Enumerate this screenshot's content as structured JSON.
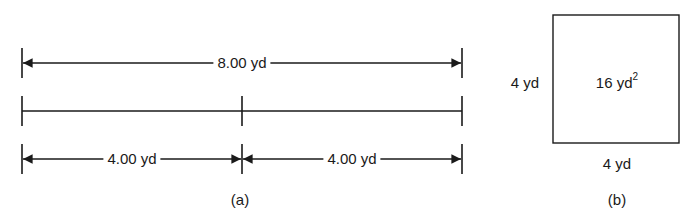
{
  "figure_a": {
    "caption": "(a)",
    "total_dimension": "8.00 yd",
    "segments": [
      {
        "label": "4.00 yd"
      },
      {
        "label": "4.00 yd"
      }
    ]
  },
  "figure_b": {
    "caption": "(b)",
    "left_side": "4 yd",
    "bottom_side": "4 yd",
    "area_value": "16 yd",
    "area_exponent": "2"
  },
  "colors": {
    "line": "#1a1a1a",
    "background": "#ffffff"
  }
}
